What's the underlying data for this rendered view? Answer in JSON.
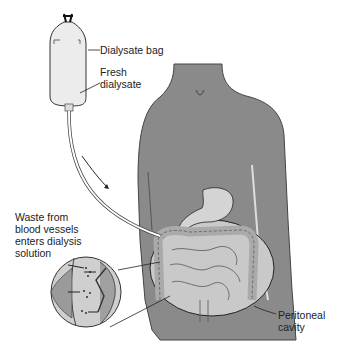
{
  "diagram": {
    "labels": {
      "bag": "Dialysate bag",
      "fresh_line1": "Fresh",
      "fresh_line2": "dialysate",
      "waste_line1": "Waste from",
      "waste_line2": "blood vessels",
      "waste_line3": "enters dialysis",
      "waste_line4": "solution",
      "cavity_line1": "Peritoneal",
      "cavity_line2": "cavity"
    },
    "colors": {
      "body": "#8a8a8a",
      "body_dark": "#5e5e5e",
      "cavity": "#c9c9c9",
      "organs": "#bdbdbd",
      "bag": "#ececec",
      "outline": "#333333"
    },
    "elements": [
      "dialysate-bag",
      "tube",
      "flow-arrow",
      "torso",
      "stomach",
      "intestines",
      "peritoneal-cavity",
      "magnified-inset"
    ]
  }
}
